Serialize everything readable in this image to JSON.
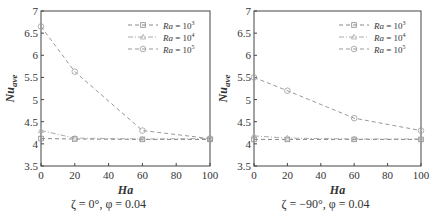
{
  "chart_data": [
    {
      "type": "line",
      "title": "",
      "caption": "ζ = 0°, φ = 0.04",
      "xlabel": "Ha",
      "ylabel": "Nu_ave",
      "xlim": [
        0,
        100
      ],
      "ylim": [
        3.5,
        7
      ],
      "xticks": [
        0,
        20,
        40,
        60,
        80,
        100
      ],
      "yticks": [
        3.5,
        4,
        4.5,
        5,
        5.5,
        6,
        6.5,
        7
      ],
      "grid": false,
      "legend_position": "upper right",
      "x": [
        0,
        20,
        60,
        100
      ],
      "series": [
        {
          "name": "Ra = 10^3",
          "marker": "square",
          "linestyle": "dashed",
          "values": [
            4.12,
            4.11,
            4.1,
            4.1
          ]
        },
        {
          "name": "Ra = 10^4",
          "marker": "triangle",
          "linestyle": "dash-dot",
          "values": [
            4.3,
            4.13,
            4.11,
            4.12
          ]
        },
        {
          "name": "Ra = 10^5",
          "marker": "circle",
          "linestyle": "dashed",
          "values": [
            6.65,
            5.63,
            4.3,
            4.12
          ]
        }
      ]
    },
    {
      "type": "line",
      "title": "",
      "caption": "ζ = −90°, φ = 0.04",
      "xlabel": "Ha",
      "ylabel": "Nu_ave",
      "xlim": [
        0,
        100
      ],
      "ylim": [
        3.5,
        7
      ],
      "xticks": [
        0,
        20,
        40,
        60,
        80,
        100
      ],
      "yticks": [
        3.5,
        4,
        4.5,
        5,
        5.5,
        6,
        6.5,
        7
      ],
      "grid": false,
      "legend_position": "upper right",
      "x": [
        0,
        20,
        60,
        100
      ],
      "series": [
        {
          "name": "Ra = 10^3",
          "marker": "square",
          "linestyle": "dashed",
          "values": [
            4.1,
            4.1,
            4.1,
            4.1
          ]
        },
        {
          "name": "Ra = 10^4",
          "marker": "triangle",
          "linestyle": "dash-dot",
          "values": [
            4.18,
            4.13,
            4.11,
            4.11
          ]
        },
        {
          "name": "Ra = 10^5",
          "marker": "circle",
          "linestyle": "dashed",
          "values": [
            5.5,
            5.2,
            4.58,
            4.3
          ]
        }
      ]
    }
  ],
  "panels": [
    {
      "caption_zeta": "ζ = 0°",
      "caption_phi": ", φ = 0.04"
    },
    {
      "caption_zeta": "ζ = −90°",
      "caption_phi": ", φ = 0.04"
    }
  ],
  "legend_labels": [
    "Ra = 10",
    "Ra = 10",
    "Ra = 10"
  ],
  "legend_exponents": [
    "3",
    "4",
    "5"
  ],
  "axis": {
    "xlabel": "Ha",
    "ylabel_main": "Nu",
    "ylabel_sub": "ave"
  },
  "colors": {
    "axis": "#444444",
    "series_1": "#888888",
    "series_2": "#aaaaaa",
    "series_3": "#999999",
    "text": "#333333"
  }
}
